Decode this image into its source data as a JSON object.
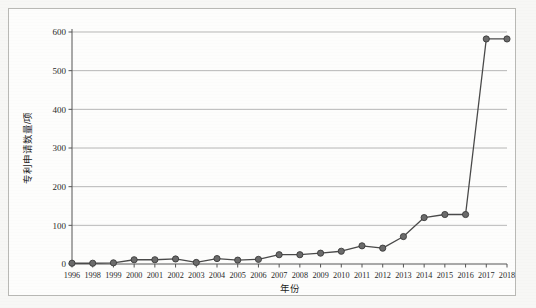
{
  "chart_data": {
    "type": "line",
    "title": "",
    "xlabel": "年份",
    "ylabel": "专利申请数量/项",
    "categories": [
      "1996",
      "1998",
      "1999",
      "2000",
      "2001",
      "2002",
      "2003",
      "2004",
      "2005",
      "2006",
      "2007",
      "2008",
      "2009",
      "2010",
      "2011",
      "2012",
      "2013",
      "2014",
      "2015",
      "2016",
      "2017",
      "2018"
    ],
    "values": [
      2,
      2,
      3,
      11,
      11,
      13,
      4,
      14,
      10,
      12,
      24,
      24,
      28,
      33,
      47,
      41,
      71,
      120,
      128,
      128,
      582,
      582
    ],
    "series": [
      {
        "name": "专利申请数量",
        "values": [
          2,
          2,
          3,
          11,
          11,
          13,
          4,
          14,
          10,
          12,
          24,
          24,
          28,
          33,
          47,
          41,
          71,
          120,
          128,
          128,
          582,
          582
        ]
      }
    ],
    "ylim": [
      0,
      600
    ],
    "yticks": [
      0,
      100,
      200,
      300,
      400,
      500,
      600
    ],
    "ytick_labels": [
      "0",
      "100",
      "200",
      "300",
      "400",
      "500",
      "600"
    ],
    "grid": "horizontal",
    "legend": "none",
    "marker": "circle",
    "line_color": "#4a4a4a",
    "marker_color": "#6b6b6b",
    "marker_edge_color": "#3a3a3a",
    "grid_color": "#9a9a9a",
    "axis_color": "#555555",
    "background_color": "#fdfdfc",
    "page_background_color": "#f7f7f5"
  }
}
